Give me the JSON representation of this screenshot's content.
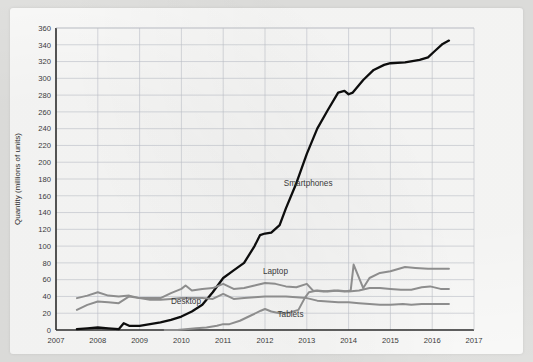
{
  "chart_data": {
    "type": "line",
    "title": "",
    "xlabel": "",
    "ylabel": "Quantity (millions of units)",
    "xlim": [
      2007,
      2017
    ],
    "ylim": [
      0,
      360
    ],
    "grid": true,
    "legend": "inline-annotations",
    "xticks": [
      "2007",
      "2008",
      "2009",
      "2010",
      "2011",
      "2012",
      "2013",
      "2014",
      "2015",
      "2016",
      "2017"
    ],
    "yticks": [
      "0",
      "20",
      "40",
      "60",
      "80",
      "100",
      "120",
      "140",
      "160",
      "180",
      "200",
      "220",
      "240",
      "260",
      "280",
      "300",
      "320",
      "340",
      "360"
    ],
    "series": [
      {
        "name": "Smartphones",
        "color": "#0d0d0d",
        "label_x": 2012.45,
        "label_y": 172,
        "points": [
          [
            2007.5,
            1
          ],
          [
            2007.75,
            2
          ],
          [
            2008.0,
            3
          ],
          [
            2008.25,
            2
          ],
          [
            2008.5,
            1
          ],
          [
            2008.62,
            8
          ],
          [
            2008.75,
            5
          ],
          [
            2009.0,
            5
          ],
          [
            2009.25,
            7
          ],
          [
            2009.5,
            9
          ],
          [
            2009.75,
            12
          ],
          [
            2010.0,
            16
          ],
          [
            2010.25,
            22
          ],
          [
            2010.5,
            30
          ],
          [
            2010.75,
            45
          ],
          [
            2011.0,
            62
          ],
          [
            2011.25,
            71
          ],
          [
            2011.5,
            80
          ],
          [
            2011.75,
            100
          ],
          [
            2011.88,
            113
          ],
          [
            2012.0,
            115
          ],
          [
            2012.15,
            116
          ],
          [
            2012.35,
            125
          ],
          [
            2012.5,
            145
          ],
          [
            2012.75,
            175
          ],
          [
            2013.0,
            210
          ],
          [
            2013.25,
            240
          ],
          [
            2013.5,
            262
          ],
          [
            2013.75,
            283
          ],
          [
            2013.9,
            285
          ],
          [
            2014.0,
            281
          ],
          [
            2014.1,
            283
          ],
          [
            2014.35,
            298
          ],
          [
            2014.6,
            310
          ],
          [
            2014.85,
            316
          ],
          [
            2015.0,
            318
          ],
          [
            2015.35,
            319
          ],
          [
            2015.7,
            322
          ],
          [
            2015.9,
            325
          ],
          [
            2016.05,
            332
          ],
          [
            2016.25,
            341
          ],
          [
            2016.4,
            345
          ]
        ]
      },
      {
        "name": "Laptop",
        "color": "#8d8d8d",
        "label_x": 2011.95,
        "label_y": 67,
        "points": [
          [
            2007.5,
            38
          ],
          [
            2007.75,
            41
          ],
          [
            2008.0,
            45
          ],
          [
            2008.25,
            41
          ],
          [
            2008.5,
            40
          ],
          [
            2008.75,
            41
          ],
          [
            2009.0,
            38
          ],
          [
            2009.25,
            38
          ],
          [
            2009.5,
            38
          ],
          [
            2009.75,
            44
          ],
          [
            2010.0,
            49
          ],
          [
            2010.1,
            53
          ],
          [
            2010.25,
            47
          ],
          [
            2010.5,
            49
          ],
          [
            2010.75,
            50
          ],
          [
            2011.0,
            55
          ],
          [
            2011.25,
            49
          ],
          [
            2011.5,
            50
          ],
          [
            2011.75,
            53
          ],
          [
            2012.0,
            56
          ],
          [
            2012.25,
            55
          ],
          [
            2012.5,
            52
          ],
          [
            2012.75,
            51
          ],
          [
            2013.0,
            55
          ],
          [
            2013.15,
            47
          ],
          [
            2013.4,
            46
          ],
          [
            2013.65,
            47
          ],
          [
            2013.9,
            46
          ],
          [
            2014.05,
            47
          ],
          [
            2014.12,
            78
          ],
          [
            2014.35,
            50
          ],
          [
            2014.5,
            62
          ],
          [
            2014.75,
            68
          ],
          [
            2015.0,
            70
          ],
          [
            2015.35,
            75
          ],
          [
            2015.6,
            74
          ],
          [
            2015.9,
            73
          ],
          [
            2016.2,
            73
          ],
          [
            2016.4,
            73
          ]
        ]
      },
      {
        "name": "Desktop",
        "color": "#8d8d8d",
        "label_x": 2009.75,
        "label_y": 31,
        "points": [
          [
            2007.5,
            24
          ],
          [
            2007.75,
            30
          ],
          [
            2008.0,
            34
          ],
          [
            2008.25,
            33
          ],
          [
            2008.5,
            32
          ],
          [
            2008.75,
            40
          ],
          [
            2009.0,
            38
          ],
          [
            2009.25,
            36
          ],
          [
            2009.5,
            36
          ],
          [
            2009.75,
            37
          ],
          [
            2010.0,
            38
          ],
          [
            2010.25,
            38
          ],
          [
            2010.5,
            38
          ],
          [
            2010.75,
            37
          ],
          [
            2011.0,
            43
          ],
          [
            2011.25,
            37
          ],
          [
            2011.5,
            38
          ],
          [
            2011.75,
            39
          ],
          [
            2012.0,
            40
          ],
          [
            2012.25,
            40
          ],
          [
            2012.5,
            40
          ],
          [
            2012.75,
            39
          ],
          [
            2013.0,
            38
          ],
          [
            2013.25,
            35
          ],
          [
            2013.5,
            34
          ],
          [
            2013.75,
            33
          ],
          [
            2014.0,
            33
          ],
          [
            2014.25,
            32
          ],
          [
            2014.5,
            31
          ],
          [
            2014.75,
            30
          ],
          [
            2015.0,
            30
          ],
          [
            2015.3,
            31
          ],
          [
            2015.5,
            30
          ],
          [
            2015.75,
            31
          ],
          [
            2016.0,
            31
          ],
          [
            2016.2,
            31
          ],
          [
            2016.4,
            31
          ]
        ]
      },
      {
        "name": "Tablets",
        "color": "#8d8d8d",
        "label_x": 2012.3,
        "label_y": 16,
        "points": [
          [
            2009.6,
            0
          ],
          [
            2009.9,
            0
          ],
          [
            2010.1,
            1
          ],
          [
            2010.35,
            2
          ],
          [
            2010.6,
            3
          ],
          [
            2010.85,
            5
          ],
          [
            2011.0,
            7
          ],
          [
            2011.15,
            7
          ],
          [
            2011.4,
            11
          ],
          [
            2011.65,
            17
          ],
          [
            2011.9,
            23
          ],
          [
            2012.0,
            25
          ],
          [
            2012.15,
            22
          ],
          [
            2012.35,
            20
          ],
          [
            2012.6,
            21
          ],
          [
            2012.8,
            24
          ],
          [
            2012.95,
            38
          ],
          [
            2013.05,
            45
          ],
          [
            2013.25,
            47
          ],
          [
            2013.5,
            46
          ],
          [
            2013.75,
            47
          ],
          [
            2014.0,
            46
          ],
          [
            2014.25,
            47
          ],
          [
            2014.5,
            50
          ],
          [
            2014.75,
            50
          ],
          [
            2015.0,
            49
          ],
          [
            2015.25,
            48
          ],
          [
            2015.5,
            48
          ],
          [
            2015.75,
            51
          ],
          [
            2015.95,
            52
          ],
          [
            2016.2,
            49
          ],
          [
            2016.4,
            49
          ]
        ]
      }
    ]
  }
}
